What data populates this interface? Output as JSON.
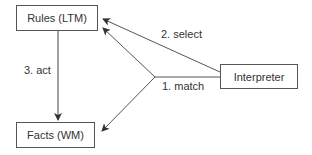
{
  "diagram": {
    "nodes": {
      "rules": {
        "label": "Rules (LTM)"
      },
      "facts": {
        "label": "Facts (WM)"
      },
      "interpreter": {
        "label": "Interpreter"
      }
    },
    "edges": {
      "match": {
        "label": "1. match",
        "from": "Interpreter",
        "to": [
          "Rules (LTM)",
          "Facts (WM)"
        ]
      },
      "select": {
        "label": "2. select",
        "from": "Interpreter",
        "to": "Rules (LTM)"
      },
      "act": {
        "label": "3. act",
        "from": "Rules (LTM)",
        "to": "Facts (WM)"
      }
    },
    "colors": {
      "line": "#555555",
      "text": "#333333",
      "background": "#ffffff"
    }
  }
}
